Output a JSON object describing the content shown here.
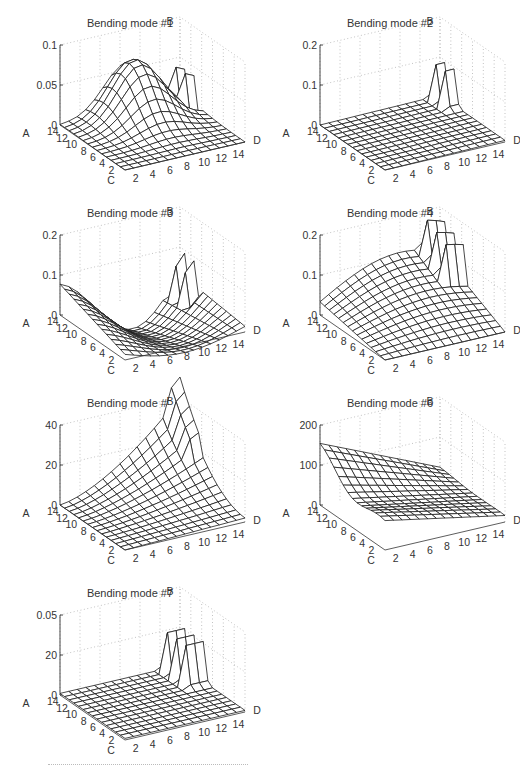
{
  "figure": {
    "panels": [
      {
        "title": "Bending mode #1",
        "z_ticks": [
          "0",
          "0.05",
          "0.1"
        ],
        "shape": "bump_center",
        "left": 0,
        "top": 0
      },
      {
        "title": "Bending mode #2",
        "z_ticks": [
          "0",
          "0.1",
          "0.2"
        ],
        "shape": "flat_edge_spike",
        "left": 260,
        "top": 0
      },
      {
        "title": "Bending mode #3",
        "z_ticks": [
          "0",
          "0.1",
          "0.2"
        ],
        "shape": "wave",
        "left": 0,
        "top": 190
      },
      {
        "title": "Bending mode #4",
        "z_ticks": [
          "0",
          "0.1",
          "0.2"
        ],
        "shape": "ramp_back",
        "left": 260,
        "top": 190
      },
      {
        "title": "Bending mode #5",
        "z_ticks": [
          "0",
          "20",
          "40"
        ],
        "shape": "bowl_back",
        "left": 0,
        "top": 380
      },
      {
        "title": "Bending mode #6",
        "z_ticks": [
          "0",
          "100",
          "200"
        ],
        "shape": "ridge_left",
        "left": 260,
        "top": 380
      },
      {
        "title": "Bending mode #7",
        "z_ticks": [
          "0",
          "20",
          "0.05"
        ],
        "shape": "flat_edge_spikes",
        "left": 0,
        "top": 570
      }
    ],
    "axis_labels": {
      "vertical": "A",
      "back": "B",
      "left": "C",
      "right": "D"
    },
    "xy_ticks": [
      "2",
      "4",
      "6",
      "8",
      "10",
      "12",
      "14"
    ]
  },
  "chart_data": [
    {
      "type": "surface",
      "title": "Bending mode #1",
      "zlabel": "A",
      "xlabel": "C",
      "ylabel": "D",
      "back_label": "B",
      "x_ticks": [
        2,
        4,
        6,
        8,
        10,
        12,
        14
      ],
      "y_ticks": [
        2,
        4,
        6,
        8,
        10,
        12,
        14
      ],
      "zlim": [
        0,
        0.1
      ],
      "z_ticks": [
        0,
        0.05,
        0.1
      ],
      "description": "Smooth single hump peaking ~0.07 near grid centre-back, spikes at far corner edge"
    },
    {
      "type": "surface",
      "title": "Bending mode #2",
      "zlabel": "A",
      "xlabel": "C",
      "ylabel": "D",
      "back_label": "B",
      "x_ticks": [
        2,
        4,
        6,
        8,
        10,
        12,
        14
      ],
      "y_ticks": [
        2,
        4,
        6,
        8,
        10,
        12,
        14
      ],
      "zlim": [
        0,
        0.2
      ],
      "z_ticks": [
        0,
        0.1,
        0.2
      ],
      "description": "Near-flat plane at ~0 with a sharp spike ~0.1 at the D edge"
    },
    {
      "type": "surface",
      "title": "Bending mode #3",
      "zlabel": "A",
      "xlabel": "C",
      "ylabel": "D",
      "back_label": "B",
      "x_ticks": [
        2,
        4,
        6,
        8,
        10,
        12,
        14
      ],
      "y_ticks": [
        2,
        4,
        6,
        8,
        10,
        12,
        14
      ],
      "zlim": [
        0,
        0.2
      ],
      "z_ticks": [
        0,
        0.1,
        0.2
      ],
      "description": "Sinusoidal wave with a deep trough around C=8 and ripple spikes near D edge"
    },
    {
      "type": "surface",
      "title": "Bending mode #4",
      "zlabel": "A",
      "xlabel": "C",
      "ylabel": "D",
      "back_label": "B",
      "x_ticks": [
        2,
        4,
        6,
        8,
        10,
        12,
        14
      ],
      "y_ticks": [
        2,
        4,
        6,
        8,
        10,
        12,
        14
      ],
      "zlim": [
        0,
        0.2
      ],
      "z_ticks": [
        0,
        0.1,
        0.2
      ],
      "description": "Surface rising toward the back to ~0.12, spikes ~0.1 near D edge"
    },
    {
      "type": "surface",
      "title": "Bending mode #5",
      "zlabel": "A",
      "xlabel": "C",
      "ylabel": "D",
      "back_label": "B",
      "x_ticks": [
        2,
        4,
        6,
        8,
        10,
        12,
        14
      ],
      "y_ticks": [
        2,
        4,
        6,
        8,
        10,
        12,
        14
      ],
      "zlim": [
        0,
        40
      ],
      "z_ticks": [
        0,
        20,
        40
      ],
      "description": "Curved surface rising steeply toward back corner to ~40"
    },
    {
      "type": "surface",
      "title": "Bending mode #6",
      "zlabel": "A",
      "xlabel": "C",
      "ylabel": "D",
      "back_label": "B",
      "x_ticks": [
        2,
        4,
        6,
        8,
        10,
        12,
        14
      ],
      "y_ticks": [
        2,
        4,
        6,
        8,
        10,
        12,
        14
      ],
      "zlim": [
        0,
        200
      ],
      "z_ticks": [
        0,
        100,
        200
      ],
      "description": "Ridge along left edge ~130-150 decreasing toward D edge"
    },
    {
      "type": "surface",
      "title": "Bending mode #7",
      "zlabel": "A",
      "xlabel": "C",
      "ylabel": "D",
      "back_label": "B",
      "x_ticks": [
        2,
        4,
        6,
        8,
        10,
        12,
        14
      ],
      "y_ticks": [
        2,
        4,
        6,
        8,
        10,
        12,
        14
      ],
      "z_tick_labels": [
        "0",
        "20",
        "0.05"
      ],
      "description": "Flat plane at ~0 with several sharp spikes near D edge"
    }
  ]
}
